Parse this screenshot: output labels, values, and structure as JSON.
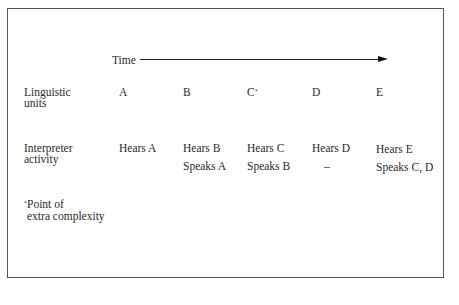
{
  "diagram": {
    "time_label": "Time",
    "rows": {
      "linguistic_units": {
        "label_line1": "Linguistic",
        "label_line2": "units",
        "cells": [
          "A",
          "B",
          "C",
          "D",
          "E"
        ],
        "marked_cell_index": 2,
        "mark": "*"
      },
      "interpreter_activity": {
        "label_line1": "Interpreter",
        "label_line2": "activity",
        "hears": [
          "Hears A",
          "Hears B",
          "Hears C",
          "Hears D",
          "Hears E"
        ],
        "speaks": [
          "",
          "Speaks A",
          "Speaks B",
          "–",
          "Speaks C, D"
        ]
      }
    },
    "footnote": {
      "mark": "*",
      "line1": "Point of",
      "line2": "extra complexity"
    }
  }
}
